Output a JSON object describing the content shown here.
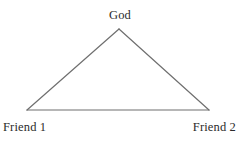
{
  "diagram": {
    "type": "triangle-relationship-diagram",
    "background_color": "#ffffff",
    "stroke_color": "#6f6f6f",
    "text_color": "#2b2b2b",
    "nodes": [
      {
        "id": "apex",
        "label": "God",
        "x": 119,
        "y": 29
      },
      {
        "id": "bottom_left",
        "label": "Friend 1",
        "x": 27,
        "y": 110
      },
      {
        "id": "bottom_right",
        "label": "Friend 2",
        "x": 209,
        "y": 110
      }
    ],
    "edges": [
      {
        "from": "bottom_left",
        "to": "apex"
      },
      {
        "from": "apex",
        "to": "bottom_right"
      },
      {
        "from": "bottom_left",
        "to": "bottom_right"
      }
    ]
  }
}
